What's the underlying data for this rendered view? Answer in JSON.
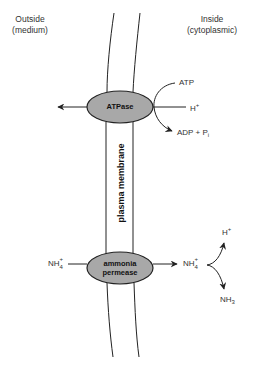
{
  "labels": {
    "outside_line1": "Outside",
    "outside_line2": "(medium)",
    "inside_line1": "Inside",
    "inside_line2": "(cytoplasmic)",
    "membrane": "plasma membrane"
  },
  "proteins": {
    "atpase": {
      "label": "ATPase",
      "fill": "#a8a8a8"
    },
    "permease": {
      "line1": "ammonia",
      "line2": "permease",
      "fill": "#a8a8a8"
    }
  },
  "atpase_reaction": {
    "substrate": "ATP",
    "proton_base": "H",
    "proton_charge": "+",
    "product_base": "ADP + P",
    "product_sub": "i"
  },
  "ammonium_transport": {
    "outside_base": "NH",
    "outside_charge": "+",
    "outside_sub": "4",
    "inside_base": "NH",
    "inside_charge": "+",
    "inside_sub": "4",
    "proton_base": "H",
    "proton_charge": "+",
    "ammonia_base": "NH",
    "ammonia_sub": "3"
  },
  "colors": {
    "line": "#222222",
    "protein_fill": "#a8a8a8"
  }
}
